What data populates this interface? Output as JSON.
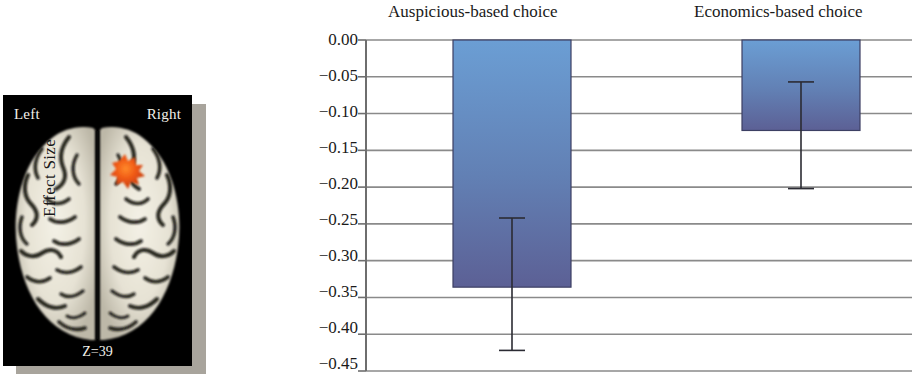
{
  "figure": {
    "brain_panel": {
      "left_label": "Left",
      "right_label": "Right",
      "slice_label": "Z=39",
      "activation_color": "#e8511a",
      "background_color": "#000000"
    }
  },
  "chart_data": {
    "type": "bar",
    "title": "",
    "categories": [
      "Auspicious-based choice",
      "Economics-based choice"
    ],
    "values": [
      -0.336,
      -0.123
    ],
    "errors_low": [
      -0.422,
      -0.202
    ],
    "errors_high": [
      -0.242,
      -0.057
    ],
    "xlabel": "",
    "ylabel": "Effect Size",
    "ylim": [
      -0.45,
      0.0
    ],
    "ytick_labels": [
      "0.00",
      "−0.05",
      "−0.10",
      "−0.15",
      "−0.20",
      "−0.25",
      "−0.30",
      "−0.35",
      "−0.40",
      "−0.45"
    ],
    "ytick_values": [
      0.0,
      -0.05,
      -0.1,
      -0.15,
      -0.2,
      -0.25,
      -0.3,
      -0.35,
      -0.4,
      -0.45
    ],
    "grid": true,
    "legend": "none",
    "bar_color_top": "#6b9ed4",
    "bar_color_bottom": "#5c6095",
    "gridline_color": "#8a8a8a",
    "axis_color": "#6e6e6e",
    "errorbar_color": "#2b2b33"
  }
}
